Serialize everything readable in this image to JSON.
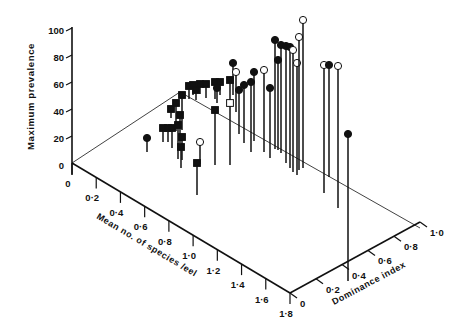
{
  "chart_data": {
    "type": "scatter",
    "subtype": "3d-stem",
    "title": "",
    "zlabel": "Maximum prevalence",
    "xlabel": "Mean no. of species /eel",
    "ylabel": "Dominance index",
    "z_ticks": [
      "0",
      "20",
      "40",
      "60",
      "80",
      "100"
    ],
    "x_ticks": [
      "0",
      "0·2",
      "0·4",
      "0·6",
      "0·8",
      "1·0",
      "1·2",
      "1·4",
      "1·6",
      "1·8"
    ],
    "y_ticks": [
      "0",
      "0·2",
      "0·4",
      "0·6",
      "0·8",
      "1·0"
    ],
    "zlim": [
      0,
      100
    ],
    "xlim": [
      0,
      1.8
    ],
    "ylim": [
      0,
      1.0
    ],
    "grid": false,
    "legend": null,
    "marker_types": [
      "filled-circle",
      "open-circle",
      "filled-square",
      "open-square"
    ],
    "points": [
      {
        "marker": "filled-circle",
        "top": [
          147,
          138
        ],
        "base": [
          147,
          152
        ]
      },
      {
        "marker": "filled-square",
        "top": [
          163,
          128
        ],
        "base": [
          163,
          142
        ]
      },
      {
        "marker": "filled-square",
        "top": [
          168,
          128
        ],
        "base": [
          168,
          142
        ]
      },
      {
        "marker": "filled-square",
        "top": [
          172,
          128
        ],
        "base": [
          172,
          148
        ]
      },
      {
        "marker": "filled-square",
        "top": [
          171,
          109
        ],
        "base": [
          171,
          118
        ]
      },
      {
        "marker": "filled-square",
        "top": [
          176,
          103
        ],
        "base": [
          176,
          131
        ]
      },
      {
        "marker": "filled-square",
        "top": [
          180,
          115
        ],
        "base": [
          180,
          143
        ]
      },
      {
        "marker": "filled-square",
        "top": [
          178,
          125
        ],
        "base": [
          178,
          159
        ]
      },
      {
        "marker": "filled-square",
        "top": [
          182,
          137
        ],
        "base": [
          182,
          160
        ]
      },
      {
        "marker": "filled-square",
        "top": [
          181,
          147
        ],
        "base": [
          181,
          168
        ]
      },
      {
        "marker": "filled-square",
        "top": [
          182,
          95
        ],
        "base": [
          182,
          130
        ]
      },
      {
        "marker": "filled-square",
        "top": [
          189,
          86
        ],
        "base": [
          189,
          99
        ]
      },
      {
        "marker": "filled-square",
        "top": [
          193,
          85
        ],
        "base": [
          193,
          95
        ]
      },
      {
        "marker": "filled-square",
        "top": [
          196,
          90
        ],
        "base": [
          196,
          100
        ]
      },
      {
        "marker": "filled-square",
        "top": [
          200,
          84
        ],
        "base": [
          200,
          94
        ]
      },
      {
        "marker": "filled-square",
        "top": [
          206,
          84
        ],
        "base": [
          206,
          98
        ]
      },
      {
        "marker": "open-circle",
        "top": [
          200,
          142
        ],
        "base": [
          200,
          164
        ]
      },
      {
        "marker": "filled-square",
        "top": [
          197,
          163
        ],
        "base": [
          197,
          195
        ]
      },
      {
        "marker": "filled-square",
        "top": [
          215,
          82
        ],
        "base": [
          215,
          99
        ]
      },
      {
        "marker": "filled-square",
        "top": [
          220,
          82
        ],
        "base": [
          220,
          95
        ]
      },
      {
        "marker": "filled-square",
        "top": [
          230,
          80
        ],
        "base": [
          230,
          101
        ]
      },
      {
        "marker": "filled-circle",
        "top": [
          217,
          88
        ],
        "base": [
          217,
          103
        ]
      },
      {
        "marker": "filled-square",
        "top": [
          215,
          110
        ],
        "base": [
          215,
          165
        ]
      },
      {
        "marker": "open-square",
        "top": [
          230,
          103
        ],
        "base": [
          230,
          165
        ]
      },
      {
        "marker": "filled-circle",
        "top": [
          233,
          63
        ],
        "base": [
          233,
          95
        ]
      },
      {
        "marker": "open-circle",
        "top": [
          236,
          72
        ],
        "base": [
          236,
          112
        ]
      },
      {
        "marker": "filled-circle",
        "top": [
          239,
          90
        ],
        "base": [
          239,
          134
        ]
      },
      {
        "marker": "filled-circle",
        "top": [
          244,
          85
        ],
        "base": [
          244,
          143
        ]
      },
      {
        "marker": "filled-circle",
        "top": [
          251,
          82
        ],
        "base": [
          251,
          152
        ]
      },
      {
        "marker": "filled-circle",
        "top": [
          254,
          72
        ],
        "base": [
          254,
          141
        ]
      },
      {
        "marker": "open-circle",
        "top": [
          264,
          70
        ],
        "base": [
          264,
          152
        ]
      },
      {
        "marker": "filled-circle",
        "top": [
          270,
          88
        ],
        "base": [
          270,
          158
        ]
      },
      {
        "marker": "filled-circle",
        "top": [
          275,
          40
        ],
        "base": [
          275,
          149
        ]
      },
      {
        "marker": "filled-circle",
        "top": [
          278,
          60
        ],
        "base": [
          278,
          150
        ]
      },
      {
        "marker": "filled-circle",
        "top": [
          281,
          45
        ],
        "base": [
          281,
          153
        ]
      },
      {
        "marker": "filled-circle",
        "top": [
          286,
          46
        ],
        "base": [
          286,
          163
        ]
      },
      {
        "marker": "filled-circle",
        "top": [
          290,
          47
        ],
        "base": [
          290,
          168
        ]
      },
      {
        "marker": "open-circle",
        "top": [
          293,
          50
        ],
        "base": [
          293,
          172
        ]
      },
      {
        "marker": "open-circle",
        "top": [
          297,
          63
        ],
        "base": [
          297,
          175
        ]
      },
      {
        "marker": "open-circle",
        "top": [
          299,
          37
        ],
        "base": [
          299,
          170
        ]
      },
      {
        "marker": "open-circle",
        "top": [
          303,
          20
        ],
        "base": [
          303,
          168
        ]
      },
      {
        "marker": "open-circle",
        "top": [
          324,
          65
        ],
        "base": [
          324,
          193
        ]
      },
      {
        "marker": "filled-circle",
        "top": [
          329,
          65
        ],
        "base": [
          329,
          177
        ]
      },
      {
        "marker": "open-circle",
        "top": [
          338,
          66
        ],
        "base": [
          338,
          208
        ]
      },
      {
        "marker": "filled-circle",
        "top": [
          348,
          134
        ],
        "base": [
          348,
          281
        ]
      }
    ]
  }
}
